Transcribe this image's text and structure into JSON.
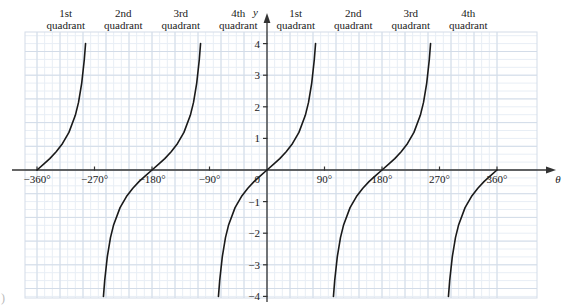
{
  "chart_data": {
    "type": "line",
    "title": "",
    "function": "y = tan(theta)",
    "xlabel": "θ",
    "ylabel": "y",
    "xlim": [
      -360,
      360
    ],
    "ylim": [
      -4,
      4
    ],
    "grid": true,
    "grid_minor_step_x": 12,
    "grid_major_step_x": 36,
    "grid_minor_step_y": 0.25,
    "grid_major_step_y": 0.75,
    "legend": "none",
    "x_ticks": [
      -360,
      -270,
      -180,
      -90,
      0,
      90,
      180,
      270,
      360
    ],
    "x_tick_labels": [
      "−360°",
      "−270°",
      "−180°",
      "−90°",
      "0",
      "90°",
      "180°",
      "270°",
      "360°"
    ],
    "y_ticks": [
      -4,
      -3,
      -2,
      -1,
      0,
      1,
      2,
      3,
      4
    ],
    "y_tick_labels": [
      "−4",
      "−3",
      "−2",
      "−1",
      "0",
      "1",
      "2",
      "3",
      "4"
    ],
    "asymptotes": [
      -270,
      -90,
      90,
      270
    ],
    "branches": [
      {
        "name": "branch--360--270",
        "x_start": -360,
        "x_end": -270
      },
      {
        "name": "branch--270--90",
        "x_start": -270,
        "x_end": -90
      },
      {
        "name": "branch--90-90",
        "x_start": -90,
        "x_end": 90
      },
      {
        "name": "branch-90-270",
        "x_start": 90,
        "x_end": 270
      },
      {
        "name": "branch-270-360",
        "x_start": 270,
        "x_end": 360
      }
    ],
    "series": [
      {
        "name": "tan",
        "color": "#1a1a1a",
        "points": [
          {
            "x": -360,
            "y": 0.0
          },
          {
            "x": -350,
            "y": 0.18
          },
          {
            "x": -340,
            "y": 0.36
          },
          {
            "x": -330,
            "y": 0.58
          },
          {
            "x": -320,
            "y": 0.84
          },
          {
            "x": -310,
            "y": 1.19
          },
          {
            "x": -300,
            "y": 1.73
          },
          {
            "x": -295,
            "y": 2.14
          },
          {
            "x": -290,
            "y": 2.75
          },
          {
            "x": -286,
            "y": 3.49
          },
          {
            "x": -284,
            "y": 4.0
          },
          {
            "x": -256,
            "y": -4.0
          },
          {
            "x": -254,
            "y": -3.49
          },
          {
            "x": -250,
            "y": -2.75
          },
          {
            "x": -245,
            "y": -2.14
          },
          {
            "x": -240,
            "y": -1.73
          },
          {
            "x": -230,
            "y": -1.19
          },
          {
            "x": -220,
            "y": -0.84
          },
          {
            "x": -210,
            "y": -0.58
          },
          {
            "x": -200,
            "y": -0.36
          },
          {
            "x": -190,
            "y": -0.18
          },
          {
            "x": -180,
            "y": 0.0
          },
          {
            "x": -170,
            "y": 0.18
          },
          {
            "x": -160,
            "y": 0.36
          },
          {
            "x": -150,
            "y": 0.58
          },
          {
            "x": -140,
            "y": 0.84
          },
          {
            "x": -130,
            "y": 1.19
          },
          {
            "x": -120,
            "y": 1.73
          },
          {
            "x": -115,
            "y": 2.14
          },
          {
            "x": -110,
            "y": 2.75
          },
          {
            "x": -106,
            "y": 3.49
          },
          {
            "x": -104,
            "y": 4.0
          },
          {
            "x": -76,
            "y": -4.0
          },
          {
            "x": -74,
            "y": -3.49
          },
          {
            "x": -70,
            "y": -2.75
          },
          {
            "x": -65,
            "y": -2.14
          },
          {
            "x": -60,
            "y": -1.73
          },
          {
            "x": -50,
            "y": -1.19
          },
          {
            "x": -40,
            "y": -0.84
          },
          {
            "x": -30,
            "y": -0.58
          },
          {
            "x": -20,
            "y": -0.36
          },
          {
            "x": -10,
            "y": -0.18
          },
          {
            "x": 0,
            "y": 0.0
          },
          {
            "x": 10,
            "y": 0.18
          },
          {
            "x": 20,
            "y": 0.36
          },
          {
            "x": 30,
            "y": 0.58
          },
          {
            "x": 40,
            "y": 0.84
          },
          {
            "x": 50,
            "y": 1.19
          },
          {
            "x": 60,
            "y": 1.73
          },
          {
            "x": 65,
            "y": 2.14
          },
          {
            "x": 70,
            "y": 2.75
          },
          {
            "x": 74,
            "y": 3.49
          },
          {
            "x": 76,
            "y": 4.0
          },
          {
            "x": 104,
            "y": -4.0
          },
          {
            "x": 106,
            "y": -3.49
          },
          {
            "x": 110,
            "y": -2.75
          },
          {
            "x": 115,
            "y": -2.14
          },
          {
            "x": 120,
            "y": -1.73
          },
          {
            "x": 130,
            "y": -1.19
          },
          {
            "x": 140,
            "y": -0.84
          },
          {
            "x": 150,
            "y": -0.58
          },
          {
            "x": 160,
            "y": -0.36
          },
          {
            "x": 170,
            "y": -0.18
          },
          {
            "x": 180,
            "y": 0.0
          },
          {
            "x": 190,
            "y": 0.18
          },
          {
            "x": 200,
            "y": 0.36
          },
          {
            "x": 210,
            "y": 0.58
          },
          {
            "x": 220,
            "y": 0.84
          },
          {
            "x": 230,
            "y": 1.19
          },
          {
            "x": 240,
            "y": 1.73
          },
          {
            "x": 245,
            "y": 2.14
          },
          {
            "x": 250,
            "y": 2.75
          },
          {
            "x": 254,
            "y": 3.49
          },
          {
            "x": 256,
            "y": 4.0
          },
          {
            "x": 284,
            "y": -4.0
          },
          {
            "x": 286,
            "y": -3.49
          },
          {
            "x": 290,
            "y": -2.75
          },
          {
            "x": 295,
            "y": -2.14
          },
          {
            "x": 300,
            "y": -1.73
          },
          {
            "x": 310,
            "y": -1.19
          },
          {
            "x": 320,
            "y": -0.84
          },
          {
            "x": 330,
            "y": -0.58
          },
          {
            "x": 340,
            "y": -0.36
          },
          {
            "x": 350,
            "y": -0.18
          },
          {
            "x": 360,
            "y": 0.0
          }
        ]
      }
    ],
    "quadrant_labels": [
      {
        "line1": "1st",
        "line2": "quadrant",
        "center_x": -315
      },
      {
        "line1": "2nd",
        "line2": "quadrant",
        "center_x": -225
      },
      {
        "line1": "3rd",
        "line2": "quadrant",
        "center_x": -135
      },
      {
        "line1": "4th",
        "line2": "quadrant",
        "center_x": -45
      },
      {
        "line1": "1st",
        "line2": "quadrant",
        "center_x": 45
      },
      {
        "line1": "2nd",
        "line2": "quadrant",
        "center_x": 135
      },
      {
        "line1": "3rd",
        "line2": "quadrant",
        "center_x": 225
      },
      {
        "line1": "4th",
        "line2": "quadrant",
        "center_x": 315
      }
    ],
    "colors": {
      "curve": "#1a1a1a",
      "axis": "#333333",
      "grid_minor": "#e8eef5",
      "grid_major": "#d3dce8",
      "text": "#1a1a1a",
      "background": "#ffffff"
    }
  },
  "figure": {
    "corner_mark": ")"
  }
}
